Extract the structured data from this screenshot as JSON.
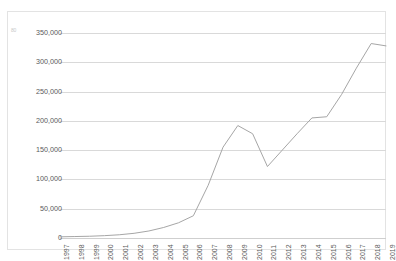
{
  "chart_data": {
    "type": "line",
    "title": "",
    "subtitle": "",
    "xlabel": "",
    "ylabel": "",
    "grid": true,
    "legend": false,
    "legend_position": "none",
    "line_color": "#a6a6a6",
    "categories": [
      "1997",
      "1998",
      "1999",
      "2000",
      "2001",
      "2002",
      "2003",
      "2004",
      "2005",
      "2006",
      "2007",
      "2008",
      "2009",
      "2010",
      "2011",
      "2012",
      "2013",
      "2014",
      "2015",
      "2016",
      "2017",
      "2018",
      "2019"
    ],
    "values": [
      2000,
      2500,
      3000,
      4000,
      5500,
      8000,
      12000,
      18000,
      26000,
      38000,
      90000,
      155000,
      192000,
      178000,
      122000,
      150000,
      178000,
      205000,
      207000,
      245000,
      290000,
      332000,
      328000
    ],
    "ylim": [
      0,
      350000
    ],
    "yticks": [
      0,
      50000,
      100000,
      150000,
      200000,
      250000,
      300000,
      350000
    ],
    "ytick_labels": [
      "0",
      "50,000",
      "100,000",
      "150,000",
      "200,000",
      "250,000",
      "300,000",
      "350,000"
    ],
    "xtick_labels": [
      "1997",
      "1998",
      "1999",
      "2000",
      "2001",
      "2002",
      "2003",
      "2004",
      "2005",
      "2006",
      "2007",
      "2008",
      "2009",
      "2010",
      "2011",
      "2012",
      "2013",
      "2014",
      "2015",
      "2016",
      "2017",
      "2018",
      "2019"
    ],
    "annotations": [
      {
        "name": "corner-artifact",
        "text": "80"
      }
    ]
  },
  "frame": {
    "border_color": "#e3e3e3",
    "background": "#ffffff"
  }
}
